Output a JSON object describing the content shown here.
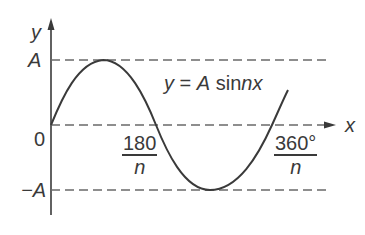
{
  "diagram": {
    "equation_label": {
      "y": "y",
      "eq": "=",
      "A": "A",
      "sin": "sin",
      "nx": "nx"
    },
    "axes": {
      "x_label": "x",
      "y_label": "y",
      "origin_label": "0"
    },
    "y_ticks": {
      "top": "A",
      "bottom": "−A"
    },
    "x_ticks": [
      {
        "numerator": "180",
        "denominator": "n"
      },
      {
        "numerator": "360°",
        "denominator": "n"
      }
    ],
    "colors": {
      "line": "#3a3a3a",
      "dashed": "#6a6a6a",
      "background": "#ffffff"
    }
  }
}
